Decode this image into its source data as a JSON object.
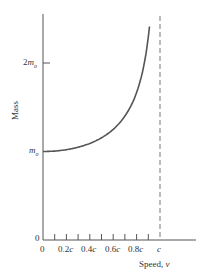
{
  "chart_data": {
    "type": "line",
    "title": "",
    "xlabel": "Speed, v",
    "ylabel": "Mass",
    "x_ticks": [
      "0",
      "0.2c",
      "0.4c",
      "0.6c",
      "0.8c",
      "c"
    ],
    "y_ticks": [
      "0",
      "m0",
      "2m0"
    ],
    "xlim": [
      0,
      1.25
    ],
    "ylim": [
      0,
      2.55
    ],
    "grid": false,
    "legend": null,
    "annotations": [
      "vertical dashed asymptote at v = c"
    ],
    "series": [
      {
        "name": "relativistic mass m = m0 / sqrt(1 - v^2/c^2)",
        "x": [
          0,
          0.1,
          0.2,
          0.3,
          0.4,
          0.5,
          0.6,
          0.7,
          0.8,
          0.85,
          0.9,
          0.915
        ],
        "y": [
          1.0,
          1.005,
          1.021,
          1.048,
          1.091,
          1.155,
          1.25,
          1.4,
          1.667,
          1.898,
          2.294,
          2.48
        ]
      }
    ]
  },
  "axes": {
    "y_label": "Mass",
    "x_label_text": "Speed, ",
    "x_label_var": "v",
    "y_tick_2m0_coef": "2",
    "y_tick_m": "m",
    "y_tick_sub": "o",
    "y_tick_zero": "0",
    "x_tick_zero": "0",
    "x_tick_02": "0.2",
    "x_tick_04": "0.4",
    "x_tick_06": "0.6",
    "x_tick_08": "0.8",
    "c": "c"
  },
  "colors": {
    "axis": "#555555",
    "curve": "#555555",
    "asymptote": "#888888"
  }
}
